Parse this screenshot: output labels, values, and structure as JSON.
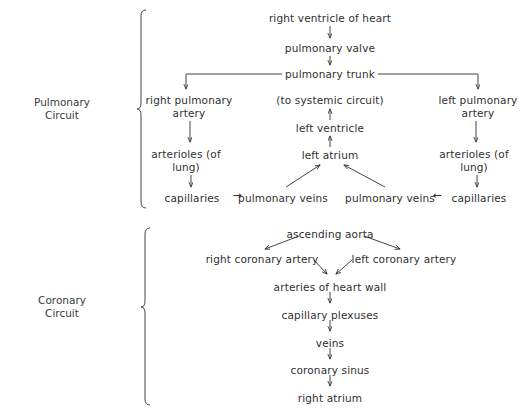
{
  "figure": {
    "type": "flow-diagram",
    "background": "#ffffff",
    "ink": "#2f2f2f",
    "sections": [
      {
        "id": "pulmonary",
        "label_line1": "Pulmonary",
        "label_line2": "Circuit",
        "bracket": {
          "x": 141,
          "top": 10,
          "bottom": 208
        }
      },
      {
        "id": "coronary",
        "label_line1": "Coronary",
        "label_line2": "Circuit",
        "bracket": {
          "x": 145,
          "top": 228,
          "bottom": 405
        }
      }
    ]
  },
  "pulmonary": {
    "nodes": [
      {
        "id": "right-ventricle-of-heart",
        "text": "right ventricle of heart",
        "x": 330,
        "y": 12
      },
      {
        "id": "pulmonary-valve",
        "text": "pulmonary valve",
        "x": 330,
        "y": 42
      },
      {
        "id": "pulmonary-trunk",
        "text": "pulmonary trunk",
        "x": 330,
        "y": 68
      },
      {
        "id": "right-pulmonary-artery",
        "line1": "right pulmonary",
        "line2": "artery",
        "x": 189,
        "y": 94
      },
      {
        "id": "to-systemic-circuit",
        "text": "(to systemic circuit)",
        "x": 330,
        "y": 94
      },
      {
        "id": "left-pulmonary-artery",
        "line1": "left pulmonary",
        "line2": "artery",
        "x": 478,
        "y": 94
      },
      {
        "id": "left-ventricle",
        "text": "left ventricle",
        "x": 330,
        "y": 122
      },
      {
        "id": "arterioles-of-lung-left",
        "line1": "arterioles (of",
        "line2": "lung)",
        "x": 186,
        "y": 148
      },
      {
        "id": "left-atrium",
        "text": "left atrium",
        "x": 330,
        "y": 149
      },
      {
        "id": "arterioles-of-lung-right",
        "line1": "arterioles (of",
        "line2": "lung)",
        "x": 474,
        "y": 148
      },
      {
        "id": "capillaries-left",
        "text": "capillaries",
        "x": 192,
        "y": 192
      },
      {
        "id": "pulmonary-veins-left",
        "text": "pulmonary veins",
        "x": 283,
        "y": 192
      },
      {
        "id": "pulmonary-veins-right",
        "text": "pulmonary veins",
        "x": 390,
        "y": 192
      },
      {
        "id": "capillaries-right",
        "text": "capillaries",
        "x": 479,
        "y": 192
      }
    ],
    "inline_arrows": [
      {
        "id": "capillaries-to-pulmonary-veins-left",
        "glyph": "→",
        "x": 237,
        "y": 191
      },
      {
        "id": "capillaries-to-pulmonary-veins-right",
        "glyph": "←",
        "x": 437,
        "y": 191
      }
    ]
  },
  "coronary": {
    "nodes": [
      {
        "id": "ascending-aorta",
        "text": "ascending aorta",
        "x": 330,
        "y": 228
      },
      {
        "id": "right-coronary-artery",
        "text": "right coronary artery",
        "x": 262,
        "y": 253
      },
      {
        "id": "left-coronary-artery",
        "text": "left coronary artery",
        "x": 404,
        "y": 253
      },
      {
        "id": "arteries-of-heart-wall",
        "text": "arteries of heart wall",
        "x": 330,
        "y": 281
      },
      {
        "id": "capillary-plexuses",
        "text": "capillary plexuses",
        "x": 330,
        "y": 309
      },
      {
        "id": "veins",
        "text": "veins",
        "x": 330,
        "y": 337
      },
      {
        "id": "coronary-sinus",
        "text": "coronary sinus",
        "x": 330,
        "y": 364
      },
      {
        "id": "right-atrium",
        "text": "right atrium",
        "x": 330,
        "y": 392
      }
    ]
  },
  "connections": {
    "pulmonary": [
      {
        "from": "right-ventricle-of-heart",
        "to": "pulmonary-valve",
        "kind": "vertical-arrow-down"
      },
      {
        "from": "pulmonary-valve",
        "to": "pulmonary-trunk",
        "kind": "vertical-arrow-down"
      },
      {
        "from": "pulmonary-trunk",
        "to": "right-pulmonary-artery",
        "kind": "elbow-left-arrow-down"
      },
      {
        "from": "pulmonary-trunk",
        "to": "left-pulmonary-artery",
        "kind": "elbow-right-arrow-down"
      },
      {
        "from": "right-pulmonary-artery",
        "to": "arterioles-of-lung-left",
        "kind": "vertical-arrow-down"
      },
      {
        "from": "left-pulmonary-artery",
        "to": "arterioles-of-lung-right",
        "kind": "vertical-arrow-down"
      },
      {
        "from": "arterioles-of-lung-left",
        "to": "capillaries-left",
        "kind": "vertical-arrow-down"
      },
      {
        "from": "arterioles-of-lung-right",
        "to": "capillaries-right",
        "kind": "vertical-arrow-down"
      },
      {
        "from": "pulmonary-veins-left",
        "to": "left-atrium",
        "kind": "diagonal-arrow-up-right"
      },
      {
        "from": "pulmonary-veins-right",
        "to": "left-atrium",
        "kind": "diagonal-arrow-up-left"
      },
      {
        "from": "left-atrium",
        "to": "left-ventricle",
        "kind": "vertical-arrow-up"
      },
      {
        "from": "left-ventricle",
        "to": "to-systemic-circuit",
        "kind": "vertical-arrow-up"
      }
    ],
    "coronary": [
      {
        "from": "ascending-aorta",
        "to": "right-coronary-artery",
        "kind": "diagonal-arrow-down-left"
      },
      {
        "from": "ascending-aorta",
        "to": "left-coronary-artery",
        "kind": "diagonal-arrow-down-right"
      },
      {
        "from": "right-coronary-artery",
        "to": "arteries-of-heart-wall",
        "kind": "diagonal-arrow-down-right"
      },
      {
        "from": "left-coronary-artery",
        "to": "arteries-of-heart-wall",
        "kind": "diagonal-arrow-down-left"
      },
      {
        "from": "arteries-of-heart-wall",
        "to": "capillary-plexuses",
        "kind": "vertical-arrow-down"
      },
      {
        "from": "capillary-plexuses",
        "to": "veins",
        "kind": "vertical-arrow-down"
      },
      {
        "from": "veins",
        "to": "coronary-sinus",
        "kind": "vertical-arrow-down"
      },
      {
        "from": "coronary-sinus",
        "to": "right-atrium",
        "kind": "vertical-arrow-down"
      }
    ]
  },
  "labels": {
    "pulmonary_circuit": {
      "line1": "Pulmonary",
      "line2": "Circuit",
      "x": 62,
      "y": 96
    },
    "coronary_circuit": {
      "line1": "Coronary",
      "line2": "Circuit",
      "x": 62,
      "y": 294
    }
  }
}
